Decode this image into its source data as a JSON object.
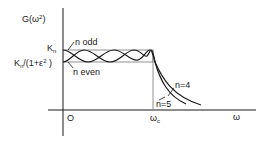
{
  "figure": {
    "type": "chebyshev-lowpass-response-sketch",
    "y_axis_label": {
      "main": "G",
      "open": "(ω",
      "sup": "2",
      "close": ")"
    },
    "x_axis_label": "ω",
    "origin_label": "O",
    "cutoff_label": {
      "main": "ω",
      "sub": "c"
    },
    "level_upper": {
      "main": "K",
      "sub": "n"
    },
    "level_lower": {
      "main": "K",
      "sub": "n",
      "rest_open": "/(1+ε",
      "sup": "2",
      "rest_close": " )"
    },
    "annotations": {
      "n_odd": "n  odd",
      "n_even": "n  even",
      "n4": "n=4",
      "n5": "n=5"
    },
    "colors": {
      "ink": "#1a1a1a",
      "box": "#777777",
      "background": "#ffffff"
    }
  }
}
